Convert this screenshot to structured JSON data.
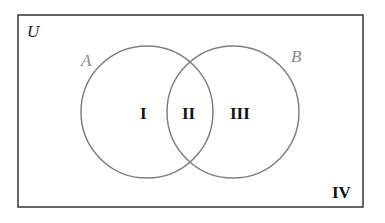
{
  "diagram": {
    "type": "venn",
    "universe": {
      "label": "U",
      "color": "#333333"
    },
    "sets": [
      {
        "label": "A",
        "color": "#808080"
      },
      {
        "label": "B",
        "color": "#808080"
      }
    ],
    "regions": [
      {
        "label": "I",
        "meaning": "A only"
      },
      {
        "label": "II",
        "meaning": "A and B"
      },
      {
        "label": "III",
        "meaning": "B only"
      },
      {
        "label": "IV",
        "meaning": "outside A and B"
      }
    ],
    "colors": {
      "border": "#333333",
      "circle_stroke": "#808080",
      "region_text": "#111111",
      "set_label_text": "#8a8a8a",
      "background": "#ffffff"
    }
  }
}
